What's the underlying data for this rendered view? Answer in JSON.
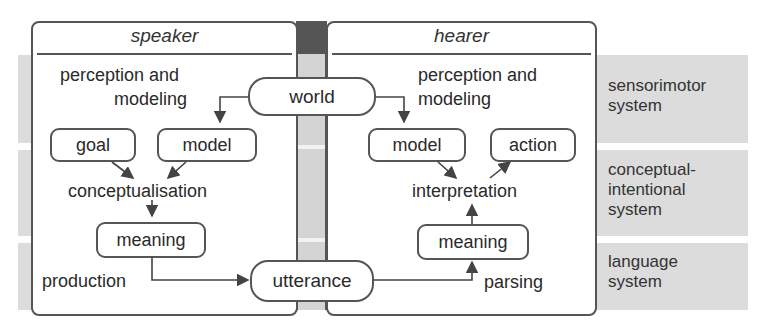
{
  "panels": {
    "speaker": {
      "title": "speaker"
    },
    "hearer": {
      "title": "hearer"
    }
  },
  "shared": {
    "world": "world",
    "utterance": "utterance"
  },
  "speaker": {
    "perception_label": "perception and",
    "perception_label_2": "modeling",
    "goal": "goal",
    "model": "model",
    "conceptualisation": "conceptualisation",
    "meaning": "meaning",
    "production": "production"
  },
  "hearer": {
    "perception_label": "perception and",
    "perception_label_2": "modeling",
    "model": "model",
    "action": "action",
    "interpretation": "interpretation",
    "meaning": "meaning",
    "parsing": "parsing"
  },
  "systems": [
    {
      "line1": "sensorimotor",
      "line2": "system",
      "line3": ""
    },
    {
      "line1": "conceptual-",
      "line2": "intentional",
      "line3": "system"
    },
    {
      "line1": "language",
      "line2": "system",
      "line3": ""
    }
  ],
  "colors": {
    "band": "#dcdcdc",
    "border": "#555555",
    "column_dark": "#555555",
    "column_light": "#d4d4d4"
  }
}
